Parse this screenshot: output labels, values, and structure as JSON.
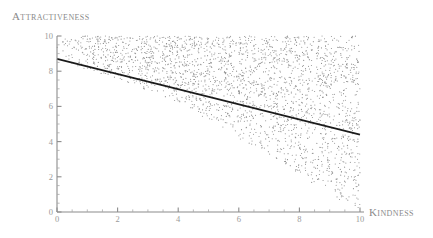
{
  "chart_data": {
    "type": "scatter",
    "title": "",
    "xlabel": "Kindness",
    "ylabel": "Attractiveness",
    "xlim": [
      0,
      10
    ],
    "ylim": [
      0,
      10
    ],
    "xticks": [
      0,
      2,
      4,
      6,
      8,
      10
    ],
    "yticks": [
      0,
      2,
      4,
      6,
      8,
      10
    ],
    "xticklabels": [
      "0",
      "2",
      "4",
      "6",
      "8",
      "10"
    ],
    "yticklabels": [
      "0",
      "2",
      "4",
      "6",
      "8",
      "10"
    ],
    "grid": false,
    "legend": false,
    "minor_ticks": true,
    "point_color": "#8e8e8e",
    "point_count": 2400,
    "point_size": 1,
    "cloud_lower_bound": {
      "comment": "approximate lower envelope of the point cloud, y as function of x",
      "x": [
        0,
        2,
        4,
        6,
        8,
        10
      ],
      "y": [
        8.6,
        7.6,
        6.2,
        4.2,
        2.1,
        0.0
      ]
    },
    "cloud_upper_bound": {
      "x": [
        0,
        10
      ],
      "y": [
        10,
        10
      ]
    },
    "series": [
      {
        "name": "fit-line",
        "type": "line",
        "color": "#1a1a1a",
        "x": [
          0,
          10
        ],
        "y": [
          8.7,
          4.4
        ],
        "slope": -0.43,
        "intercept": 8.7
      }
    ]
  },
  "labels": {
    "y_axis_title": "Attractiveness",
    "x_axis_title": "Kindness"
  }
}
